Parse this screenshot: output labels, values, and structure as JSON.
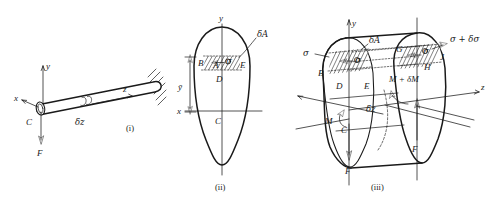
{
  "figure": {
    "caption_style": "roman-numeral",
    "background_color": "#ffffff",
    "line_color": "#1a1a1a",
    "panels": [
      {
        "id": "i",
        "caption": "(i)",
        "description": "cantilever-rod-with-end-load",
        "labels": {
          "axis_x": "x",
          "axis_y": "y",
          "axis_z": "z",
          "centroid": "C",
          "force": "F",
          "element_length": "δz"
        }
      },
      {
        "id": "ii",
        "caption": "(ii)",
        "description": "cross-section-with-elemental-area",
        "labels": {
          "axis_x": "x",
          "axis_y": "y",
          "centroid": "C",
          "point_A": "A",
          "point_B": "B",
          "point_D": "D",
          "point_E": "E",
          "elemental_area": "δA",
          "stress": "σ",
          "centroid_distance": "ȳ"
        }
      },
      {
        "id": "iii",
        "caption": "(iii)",
        "description": "beam-element-with-bending-moments-and-stresses",
        "labels": {
          "axis_y": "y",
          "axis_z": "z",
          "centroid_near": "C",
          "point_B": "B",
          "point_D": "D",
          "point_E": "E",
          "point_G": "G",
          "point_H": "H",
          "point_J": "J",
          "elemental_area": "δA",
          "stress_near": "σ",
          "stress_far": "σ + δσ",
          "moment_near": "M",
          "moment_far": "M + δM",
          "shear_near": "F",
          "shear_far": "F",
          "element_length": "δz"
        }
      }
    ]
  }
}
